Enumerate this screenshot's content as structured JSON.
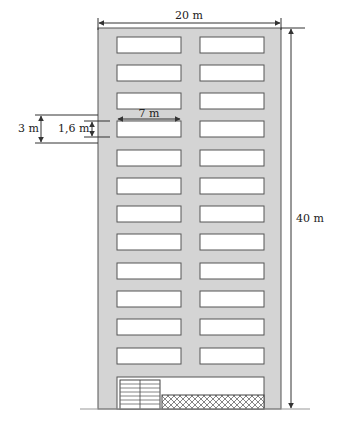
{
  "diagram": {
    "colors": {
      "facade": "#d4d4d4",
      "outline": "#555555",
      "window": "#ffffff",
      "dimension_line": "#333333",
      "text": "#222222"
    },
    "labels": {
      "width": "20 m",
      "height": "40 m",
      "window_width": "7 m",
      "floor_height": "3 m",
      "window_height": "1,6 m"
    },
    "floors_with_windows": 12,
    "windows_per_floor": 2,
    "ground_floor": {
      "door": "garage-door",
      "panel": "cross-hatched panel"
    }
  }
}
